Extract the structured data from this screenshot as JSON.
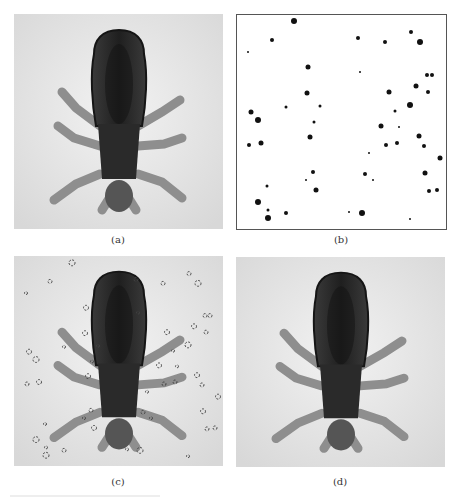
{
  "figure": {
    "panels": [
      {
        "id": "a",
        "label": "(a)",
        "content": "original-insect-image"
      },
      {
        "id": "b",
        "label": "(b)",
        "content": "binary-noise-mask"
      },
      {
        "id": "c",
        "label": "(c)",
        "content": "noisy-insect-image"
      },
      {
        "id": "d",
        "label": "(d)",
        "content": "restored-insect-image"
      }
    ],
    "colors": {
      "photo_background": "#e6e6e6",
      "insect_dark": "#2a2a2a",
      "insect_mid": "#6a6a6a",
      "leg_color": "#9a9a9a",
      "mask_dot": "#111111",
      "mask_border": "#555555"
    },
    "mask_dots": [
      [
        294,
        21,
        3
      ],
      [
        272,
        40,
        2
      ],
      [
        248,
        52,
        1
      ],
      [
        308,
        67,
        2.5
      ],
      [
        307,
        93,
        2.5
      ],
      [
        286,
        107,
        1.5
      ],
      [
        251,
        112,
        2.5
      ],
      [
        258,
        120,
        3
      ],
      [
        320,
        106,
        1.5
      ],
      [
        358,
        38,
        2
      ],
      [
        385,
        42,
        2
      ],
      [
        411,
        32,
        2
      ],
      [
        420,
        42,
        3
      ],
      [
        427,
        75,
        2
      ],
      [
        432,
        75,
        2
      ],
      [
        416,
        86,
        2.5
      ],
      [
        389,
        92,
        2.5
      ],
      [
        428,
        92,
        2
      ],
      [
        410,
        105,
        3
      ],
      [
        395,
        111,
        1.5
      ],
      [
        360,
        72,
        1
      ],
      [
        249,
        145,
        2
      ],
      [
        261,
        143,
        2.5
      ],
      [
        314,
        122,
        1.5
      ],
      [
        310,
        137,
        2.5
      ],
      [
        313,
        172,
        2
      ],
      [
        306,
        180,
        1
      ],
      [
        316,
        190,
        2.5
      ],
      [
        267,
        186,
        1.5
      ],
      [
        258,
        202,
        3
      ],
      [
        268,
        210,
        1.5
      ],
      [
        268,
        218,
        3
      ],
      [
        286,
        213,
        2
      ],
      [
        381,
        126,
        2.5
      ],
      [
        399,
        127,
        1
      ],
      [
        419,
        136,
        2.5
      ],
      [
        386,
        145,
        2
      ],
      [
        397,
        143,
        2
      ],
      [
        424,
        146,
        2
      ],
      [
        369,
        153,
        1
      ],
      [
        440,
        158,
        2.5
      ],
      [
        365,
        174,
        2
      ],
      [
        373,
        180,
        1
      ],
      [
        425,
        173,
        2.5
      ],
      [
        429,
        191,
        2
      ],
      [
        437,
        190,
        2
      ],
      [
        349,
        212,
        1
      ],
      [
        362,
        213,
        3
      ],
      [
        410,
        219,
        1
      ]
    ]
  }
}
